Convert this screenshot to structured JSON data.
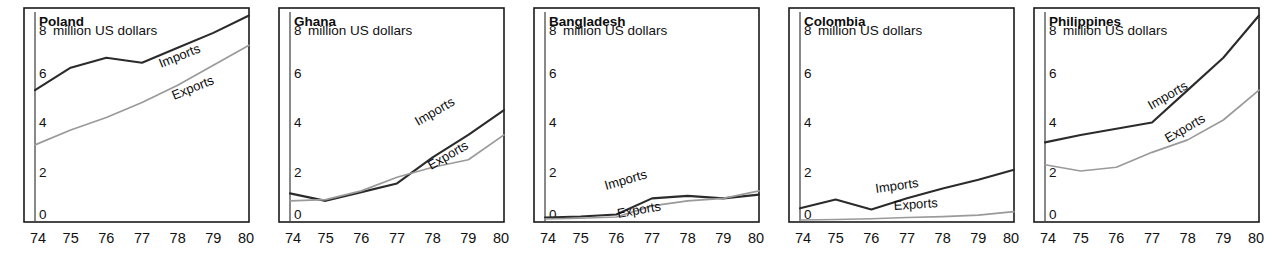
{
  "figure": {
    "unit_label": "million US dollars",
    "x_ticks": [
      "74",
      "75",
      "76",
      "77",
      "78",
      "79",
      "80"
    ],
    "y_ticks": [
      "0",
      "2",
      "4",
      "6",
      "8"
    ],
    "series_names": {
      "imports": "Imports",
      "exports": "Exports"
    },
    "colors": {
      "imports": "#2b2b2b",
      "exports": "#9a9a9a",
      "frame": "#1a1a1a",
      "text": "#111111"
    }
  },
  "chart_data": [
    {
      "type": "line",
      "title": "Poland",
      "xlabel": "",
      "ylabel": "million US dollars",
      "x": [
        74,
        75,
        76,
        77,
        78,
        79,
        80
      ],
      "xlim": [
        74,
        80
      ],
      "ylim": [
        0,
        8.6
      ],
      "yticks": [
        0,
        2,
        4,
        6,
        8
      ],
      "grid": false,
      "legend": "inline-annotations",
      "series": [
        {
          "name": "Imports",
          "values": [
            5.3,
            6.2,
            6.6,
            6.4,
            7.0,
            7.6,
            8.3
          ]
        },
        {
          "name": "Exports",
          "values": [
            3.1,
            3.7,
            4.2,
            4.8,
            5.5,
            6.3,
            7.1
          ]
        }
      ]
    },
    {
      "type": "line",
      "title": "Ghana",
      "xlabel": "",
      "ylabel": "million US dollars",
      "x": [
        74,
        75,
        76,
        77,
        78,
        79,
        80
      ],
      "xlim": [
        74,
        80
      ],
      "ylim": [
        0,
        8.6
      ],
      "yticks": [
        0,
        2,
        4,
        6,
        8
      ],
      "grid": false,
      "legend": "inline-annotations",
      "series": [
        {
          "name": "Imports",
          "values": [
            1.15,
            0.85,
            1.2,
            1.55,
            2.6,
            3.5,
            4.5
          ]
        },
        {
          "name": "Exports",
          "values": [
            0.85,
            0.9,
            1.25,
            1.8,
            2.2,
            2.5,
            3.5
          ]
        }
      ]
    },
    {
      "type": "line",
      "title": "Bangladesh",
      "xlabel": "",
      "ylabel": "million US dollars",
      "x": [
        74,
        75,
        76,
        77,
        78,
        79,
        80
      ],
      "xlim": [
        74,
        80
      ],
      "ylim": [
        0,
        8.6
      ],
      "yticks": [
        0,
        2,
        4,
        6,
        8
      ],
      "grid": false,
      "legend": "inline-annotations",
      "series": [
        {
          "name": "Imports",
          "values": [
            0.18,
            0.22,
            0.3,
            0.95,
            1.05,
            0.95,
            1.1
          ]
        },
        {
          "name": "Exports",
          "values": [
            0.12,
            0.15,
            0.2,
            0.65,
            0.85,
            0.95,
            1.25
          ]
        }
      ]
    },
    {
      "type": "line",
      "title": "Colombia",
      "xlabel": "",
      "ylabel": "million US dollars",
      "x": [
        74,
        75,
        76,
        77,
        78,
        79,
        80
      ],
      "xlim": [
        74,
        80
      ],
      "ylim": [
        0,
        8.6
      ],
      "yticks": [
        0,
        2,
        4,
        6,
        8
      ],
      "grid": false,
      "legend": "inline-annotations",
      "series": [
        {
          "name": "Imports",
          "values": [
            0.55,
            0.9,
            0.5,
            0.95,
            1.35,
            1.7,
            2.1
          ]
        },
        {
          "name": "Exports",
          "values": [
            0.08,
            0.1,
            0.13,
            0.18,
            0.22,
            0.28,
            0.42
          ]
        }
      ]
    },
    {
      "type": "line",
      "title": "Philippines",
      "xlabel": "",
      "ylabel": "million US dollars",
      "x": [
        74,
        75,
        76,
        77,
        78,
        79,
        80
      ],
      "xlim": [
        74,
        80
      ],
      "ylim": [
        0,
        8.6
      ],
      "yticks": [
        0,
        2,
        4,
        6,
        8
      ],
      "grid": false,
      "legend": "inline-annotations",
      "series": [
        {
          "name": "Imports",
          "values": [
            3.2,
            3.5,
            3.75,
            4.0,
            5.3,
            6.6,
            8.3
          ]
        },
        {
          "name": "Exports",
          "values": [
            2.3,
            2.05,
            2.2,
            2.8,
            3.3,
            4.1,
            5.3
          ]
        }
      ]
    }
  ],
  "panels": [
    {
      "title": "Poland",
      "left": 11,
      "annot": {
        "imports": {
          "x": 150,
          "y": 68,
          "rot": -22
        },
        "exports": {
          "x": 163,
          "y": 100,
          "rot": -22
        }
      }
    },
    {
      "title": "Ghana",
      "left": 266,
      "annot": {
        "imports": {
          "x": 152,
          "y": 126,
          "rot": -30
        },
        "exports": {
          "x": 165,
          "y": 170,
          "rot": -30
        }
      }
    },
    {
      "title": "Bangladesh",
      "left": 521,
      "annot": {
        "imports": {
          "x": 85,
          "y": 190,
          "rot": -16
        },
        "exports": {
          "x": 97,
          "y": 218,
          "rot": -10
        }
      }
    },
    {
      "title": "Colombia",
      "left": 776,
      "annot": {
        "imports": {
          "x": 100,
          "y": 193,
          "rot": -8
        },
        "exports": {
          "x": 118,
          "y": 210,
          "rot": -4
        }
      }
    },
    {
      "title": "Philippines",
      "left": 1021,
      "annot": {
        "imports": {
          "x": 130,
          "y": 110,
          "rot": -30
        },
        "exports": {
          "x": 147,
          "y": 143,
          "rot": -30
        }
      }
    }
  ]
}
